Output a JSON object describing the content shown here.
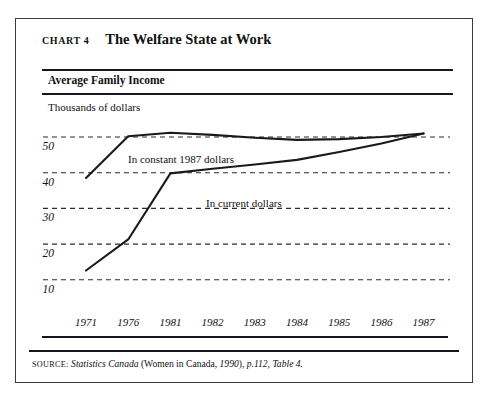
{
  "figure": {
    "chart_number": "Chart 4",
    "title": "The Welfare State at Work",
    "panel_label": "Average Family Income",
    "source_kicker": "Source:",
    "source_italic_1": "Statistics Canada",
    "source_plain_1": " (Women in Canada, ",
    "source_italic_2": "1990",
    "source_plain_2": "), ",
    "source_italic_3": "p.112, Table 4.",
    "source_full": "Source: Statistics Canada (Women in Canada, 1990), p.112, Table 4."
  },
  "chart_data": {
    "type": "line",
    "title": "Average Family Income",
    "xlabel": "",
    "ylabel": "Thousands of dollars",
    "ylim": [
      5,
      55
    ],
    "yticks": [
      10,
      20,
      30,
      40,
      50
    ],
    "ytick_labels": [
      "10",
      "20",
      "30",
      "40",
      "50"
    ],
    "grid": true,
    "grid_style": "dashed-horizontal",
    "legend": "inline-annotations",
    "categories": [
      "1971",
      "1976",
      "1981",
      "1982",
      "1983",
      "1984",
      "1985",
      "1986",
      "1987"
    ],
    "x": [
      1971,
      1976,
      1981,
      1982,
      1983,
      1984,
      1985,
      1986,
      1987
    ],
    "series": [
      {
        "name": "In constant 1987 dollars",
        "values": [
          38.5,
          50.2,
          51.2,
          50.6,
          49.8,
          49.2,
          49.4,
          50.0,
          51.0
        ],
        "color": "#1a1a1a"
      },
      {
        "name": "In current dollars",
        "values": [
          12.6,
          21.3,
          39.8,
          41.1,
          42.3,
          43.6,
          45.8,
          48.2,
          51.0
        ],
        "color": "#1a1a1a"
      }
    ],
    "annotations": [
      {
        "text": "In constant 1987 dollars",
        "x": 1977.3,
        "y": 45.5
      },
      {
        "text": "In current dollars",
        "x": 1981.6,
        "y": 36.0
      }
    ]
  },
  "colors": {
    "ink": "#16161c",
    "line": "#1a1a1a",
    "grid": "#2b2b33",
    "frame": "#3a3a46",
    "paper": "#ffffff"
  }
}
